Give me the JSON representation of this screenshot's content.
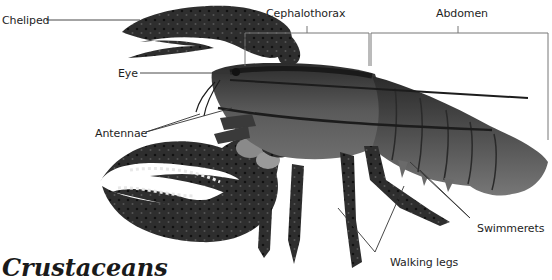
{
  "diagram": {
    "labels": {
      "cheliped": "Cheliped",
      "cephalothorax": "Cephalothorax",
      "abdomen": "Abdomen",
      "eye": "Eye",
      "antennae": "Antennae",
      "swimmerets": "Swimmerets",
      "walking_legs": "Walking legs"
    },
    "cut_off_heading": "Crustaceans",
    "colors": {
      "body": "#3a3a3a",
      "body_light": "#7a7a7a",
      "claw": "#2a2a2a",
      "leader_line": "#333333",
      "bracket_line": "#777777",
      "text": "#1e1e1e"
    }
  }
}
